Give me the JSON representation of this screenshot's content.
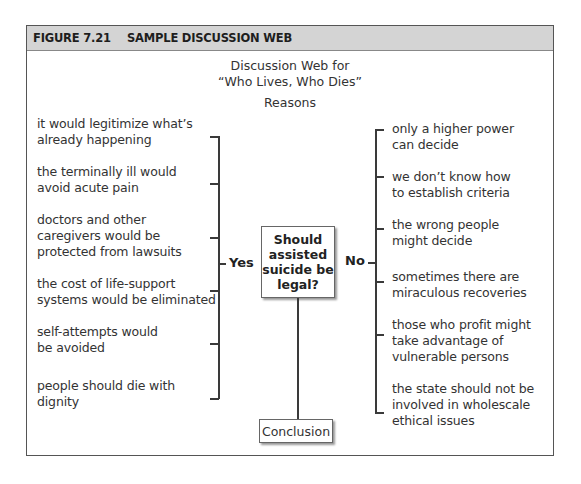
{
  "figure": {
    "number": "FIGURE 7.21",
    "title": "SAMPLE DISCUSSION WEB"
  },
  "web": {
    "title_line1": "Discussion Web for",
    "title_line2": "“Who Lives, Who Dies”",
    "reasons_label": "Reasons",
    "question": "Should assisted suicide be legal?",
    "yes_label": "Yes",
    "no_label": "No",
    "conclusion_label": "Conclusion"
  },
  "yes_reasons": [
    {
      "l1": "it would legitimize what’s",
      "l2": "already happening",
      "l3": ""
    },
    {
      "l1": "the terminally ill would",
      "l2": "avoid acute pain",
      "l3": ""
    },
    {
      "l1": "doctors and other",
      "l2": "caregivers would be",
      "l3": "protected from lawsuits"
    },
    {
      "l1": "the cost of life-support",
      "l2": "systems would be eliminated",
      "l3": ""
    },
    {
      "l1": "self-attempts would",
      "l2": "be avoided",
      "l3": ""
    },
    {
      "l1": "people should die with",
      "l2": "dignity",
      "l3": ""
    }
  ],
  "no_reasons": [
    {
      "l1": "only a higher power",
      "l2": "can decide",
      "l3": ""
    },
    {
      "l1": "we don’t know how",
      "l2": "to establish criteria",
      "l3": ""
    },
    {
      "l1": "the wrong people",
      "l2": "might decide",
      "l3": ""
    },
    {
      "l1": "sometimes there are",
      "l2": "miraculous recoveries",
      "l3": ""
    },
    {
      "l1": "those who profit might",
      "l2": "take advantage of",
      "l3": "vulnerable persons"
    },
    {
      "l1": "the state should not be",
      "l2": "involved in wholescale",
      "l3": "ethical issues"
    }
  ]
}
